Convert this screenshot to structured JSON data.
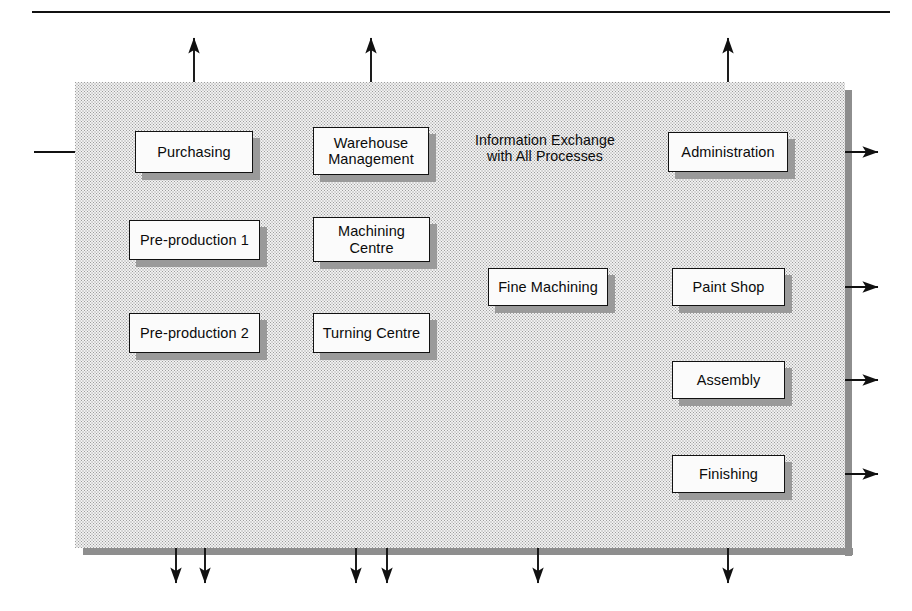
{
  "diagram": {
    "top_rule": {
      "x": 32,
      "y": 11,
      "width": 858,
      "height": 2.4,
      "color": "#111111"
    },
    "panel": {
      "x": 75,
      "y": 82,
      "width": 770,
      "height": 466,
      "fill_color": "#f1f1f1",
      "edge_color": "#8e8e8e",
      "edge_width": 7
    },
    "box_style": {
      "fill": "#fbfbfb",
      "border": "#111111",
      "shadow": "#9a9a9a",
      "shadow_offset": 7
    },
    "annotation": {
      "line1": "Information Exchange",
      "line2": "with All Processes",
      "x": 452,
      "y": 132,
      "width": 186
    },
    "nodes": [
      {
        "id": "purchasing",
        "label": "Purchasing",
        "x": 135,
        "y": 131,
        "w": 118,
        "h": 42
      },
      {
        "id": "warehouse",
        "label": "Warehouse\nManagement",
        "x": 313,
        "y": 127,
        "w": 116,
        "h": 48
      },
      {
        "id": "administration",
        "label": "Administration",
        "x": 668,
        "y": 132,
        "w": 120,
        "h": 40
      },
      {
        "id": "preprod1",
        "label": "Pre-production 1",
        "x": 129,
        "y": 220,
        "w": 131,
        "h": 40
      },
      {
        "id": "machining",
        "label": "Machining\nCentre",
        "x": 313,
        "y": 217,
        "w": 117,
        "h": 45
      },
      {
        "id": "preprod2",
        "label": "Pre-production 2",
        "x": 129,
        "y": 313,
        "w": 131,
        "h": 40
      },
      {
        "id": "turning",
        "label": "Turning Centre",
        "x": 313,
        "y": 313,
        "w": 117,
        "h": 40
      },
      {
        "id": "finemach",
        "label": "Fine Machining",
        "x": 488,
        "y": 268,
        "w": 120,
        "h": 38
      },
      {
        "id": "paintshop",
        "label": "Paint Shop",
        "x": 672,
        "y": 268,
        "w": 113,
        "h": 38
      },
      {
        "id": "assembly",
        "label": "Assembly",
        "x": 672,
        "y": 361,
        "w": 113,
        "h": 38
      },
      {
        "id": "finishing",
        "label": "Finishing",
        "x": 672,
        "y": 455,
        "w": 113,
        "h": 38
      }
    ],
    "connector_color": "#111111",
    "connectors": [
      {
        "name": "external-in-purchasing",
        "path": "M 34 152 L 131 152",
        "arrow_end": true
      },
      {
        "name": "purchasing-to-warehouse",
        "path": "M 253 152 L 309 152",
        "arrow_end": true
      },
      {
        "name": "purchasing-up-external",
        "path": "M 194 123 L 194 38",
        "arrow_end": true,
        "arrow_start": true,
        "start_at": "M 194 36 L 194 125"
      },
      {
        "name": "warehouse-up-external",
        "path": "M 371 120 L 371 38",
        "arrow_end": true,
        "arrow_start": true
      },
      {
        "name": "administration-up-external",
        "path": "M 728 124 L 728 38",
        "arrow_end": true,
        "arrow_start": true
      },
      {
        "name": "administration-to-info-label",
        "path": "M 664 152 L 624 152",
        "arrow_end": true
      },
      {
        "name": "administration-right-external",
        "path": "M 792 152 L 878 152",
        "arrow_end": true,
        "arrow_start": true
      },
      {
        "name": "warehouse-down-distribution",
        "path": "M 371 175 L 371 204",
        "arrow_end": false
      },
      {
        "name": "distribution-bus",
        "path": "M 103 204 L 638 204",
        "arrow_end": false
      },
      {
        "name": "bus-to-preprod1",
        "path": "M 103 204 L 103 240 L 125 240",
        "arrow_end": true
      },
      {
        "name": "bus-to-preprod2",
        "path": "M 103 240 L 103 333 L 125 333",
        "arrow_end": true
      },
      {
        "name": "bus-to-finemachining",
        "path": "M 477 204 L 477 278 L 484 278",
        "arrow_end": true
      },
      {
        "name": "bus-to-paintshop",
        "path": "M 638 204 L 638 279 L 668 279",
        "arrow_end": true
      },
      {
        "name": "bus-down-assembly-finishing",
        "path": "M 638 279 L 638 466 L 668 466",
        "arrow_end": true
      },
      {
        "name": "preprod1-to-machining",
        "path": "M 260 240 L 309 240",
        "arrow_end": true
      },
      {
        "name": "preprod2-to-turning",
        "path": "M 260 333 L 309 333",
        "arrow_end": true
      },
      {
        "name": "preprod2-up-preprod1",
        "path": "M 210 307 L 210 266",
        "arrow_end": true
      },
      {
        "name": "turning-up-machining",
        "path": "M 387 307 L 387 267",
        "arrow_end": true
      },
      {
        "name": "machining-to-finemachining",
        "path": "M 437 245 L 458 245 L 458 283 L 484 283",
        "arrow_end": true
      },
      {
        "name": "turning-to-finemachining",
        "path": "M 437 337 L 458 337 L 458 292 L 484 292",
        "arrow_end": true
      },
      {
        "name": "finemachining-to-paintshop-a",
        "path": "M 612 277 L 668 277",
        "arrow_end": true
      },
      {
        "name": "finemachining-to-paintshop-b",
        "path": "M 612 291 L 668 291",
        "arrow_end": true
      },
      {
        "name": "finemachining-to-assembly-a",
        "path": "M 612 291 L 612 372 L 668 372",
        "arrow_end": true
      },
      {
        "name": "finemachining-to-assembly-b",
        "path": "M 612 386 L 668 386",
        "arrow_end": true
      },
      {
        "name": "paintshop-to-assembly",
        "path": "M 728 310 L 728 357",
        "arrow_end": true
      },
      {
        "name": "assembly-to-finishing",
        "path": "M 728 403 L 728 451",
        "arrow_end": true
      },
      {
        "name": "paintshop-right-external",
        "path": "M 790 287 L 878 287",
        "arrow_end": true,
        "arrow_start": true
      },
      {
        "name": "assembly-right-external",
        "path": "M 790 380 L 878 380",
        "arrow_end": true,
        "arrow_start": true
      },
      {
        "name": "finishing-right-external",
        "path": "M 790 474 L 878 474",
        "arrow_end": true,
        "arrow_start": true
      },
      {
        "name": "preprod2-down-external",
        "path": "M 176 360 L 176 583",
        "arrow_end": true,
        "arrow_start": true
      },
      {
        "name": "preprod2-down-external-2",
        "path": "M 205 358 L 205 583",
        "arrow_end": true
      },
      {
        "name": "turning-down-external",
        "path": "M 356 360 L 356 583",
        "arrow_end": true,
        "arrow_start": true
      },
      {
        "name": "turning-down-external-2",
        "path": "M 387 358 L 387 583",
        "arrow_end": true
      },
      {
        "name": "finemachining-down-external",
        "path": "M 538 313 L 538 583",
        "arrow_end": true,
        "arrow_start": true
      },
      {
        "name": "finishing-down-external",
        "path": "M 728 497 L 728 583",
        "arrow_end": true
      }
    ],
    "external_arrows_bottom_x": [
      176,
      205,
      356,
      387,
      538,
      728
    ],
    "external_arrows_top_x": [
      194,
      371,
      728
    ]
  }
}
